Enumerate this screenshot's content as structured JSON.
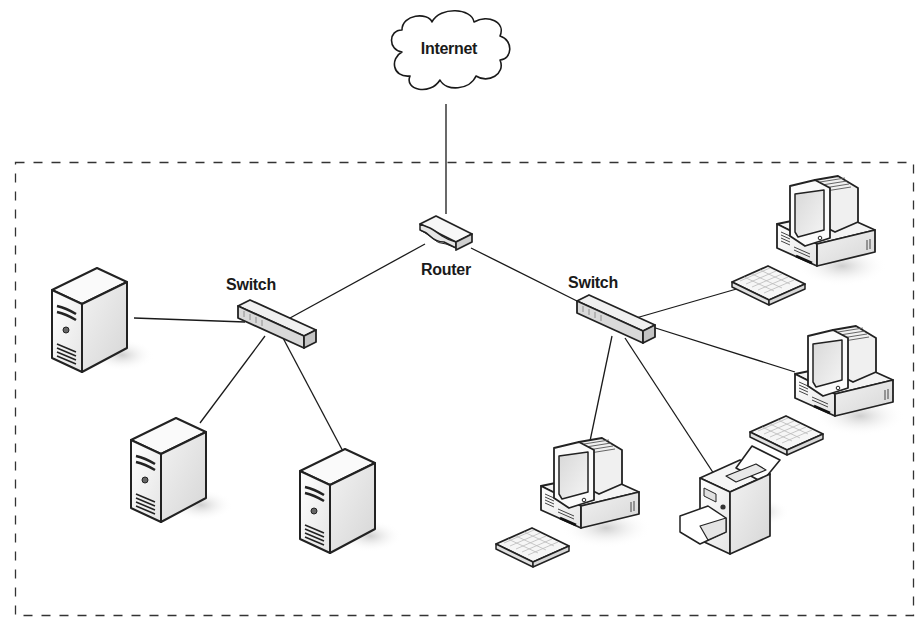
{
  "diagram": {
    "type": "network-topology",
    "boundary": {
      "style": "dashed",
      "color": "#333333"
    },
    "line_color": "#1a1a1a",
    "nodes": {
      "internet": {
        "label": "Internet",
        "kind": "cloud"
      },
      "router": {
        "label": "Router",
        "kind": "router"
      },
      "switch_left": {
        "label": "Switch",
        "kind": "switch"
      },
      "switch_right": {
        "label": "Switch",
        "kind": "switch"
      },
      "server_1": {
        "label": "",
        "kind": "server"
      },
      "server_2": {
        "label": "",
        "kind": "server"
      },
      "server_3": {
        "label": "",
        "kind": "server"
      },
      "workstation_1": {
        "label": "",
        "kind": "workstation"
      },
      "workstation_2": {
        "label": "",
        "kind": "workstation"
      },
      "workstation_3": {
        "label": "",
        "kind": "workstation"
      },
      "printer": {
        "label": "",
        "kind": "printer"
      }
    },
    "edges": [
      [
        "internet",
        "router"
      ],
      [
        "router",
        "switch_left"
      ],
      [
        "router",
        "switch_right"
      ],
      [
        "switch_left",
        "server_1"
      ],
      [
        "switch_left",
        "server_2"
      ],
      [
        "switch_left",
        "server_3"
      ],
      [
        "switch_right",
        "workstation_1"
      ],
      [
        "switch_right",
        "workstation_2"
      ],
      [
        "switch_right",
        "workstation_3"
      ],
      [
        "switch_right",
        "printer"
      ]
    ]
  }
}
